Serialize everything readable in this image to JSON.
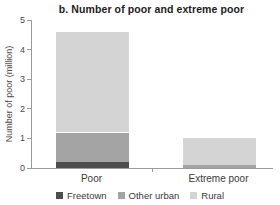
{
  "title": "b. Number of poor and extreme poor",
  "chart_data": {
    "type": "bar",
    "stacked": true,
    "title": "b. Number of poor and extreme poor",
    "ylabel": "Number of poor (million)",
    "xlabel": "",
    "categories": [
      "Poor",
      "Extreme poor"
    ],
    "series": [
      {
        "name": "Freetown",
        "color": "#4d4d4d",
        "values": [
          0.2,
          0.0
        ]
      },
      {
        "name": "Other urban",
        "color": "#a4a4a4",
        "values": [
          1.0,
          0.1
        ]
      },
      {
        "name": "Rural",
        "color": "#d4d4d4",
        "values": [
          3.4,
          0.9
        ]
      }
    ],
    "totals": [
      4.6,
      1.0
    ],
    "ylim": [
      0,
      5
    ],
    "yticks": [
      0,
      1,
      2,
      3,
      4,
      5
    ],
    "grid": false,
    "legend_position": "bottom"
  },
  "colors": {
    "axis": "#9b9b9b",
    "tick_text": "#4a4a4a",
    "title_text": "#1c1c1c",
    "background": "#ffffff"
  }
}
